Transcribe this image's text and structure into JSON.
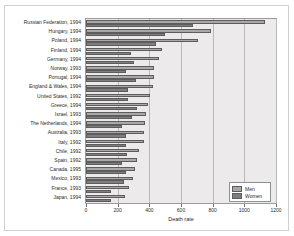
{
  "chart_data": {
    "type": "bar",
    "orientation": "horizontal",
    "title": "",
    "xlabel": "Death rate",
    "ylabel": "",
    "xlim": [
      0,
      1200
    ],
    "xticks": [
      0,
      200,
      400,
      600,
      800,
      1000,
      1200
    ],
    "xtick_labels": [
      "0",
      "200",
      "400",
      "600",
      "800",
      "1000",
      "1200"
    ],
    "grid": "vertical",
    "legend_position": "lower-right",
    "legend": [
      "Men",
      "Women"
    ],
    "categories": [
      "Russian Federation, 1994",
      "Hungary, 1994",
      "Poland, 1994",
      "Finland, 1994",
      "Germany, 1994",
      "Norway, 1993",
      "Portugal, 1994",
      "England & Wales, 1994",
      "United States, 1992",
      "Greece, 1994",
      "Israel, 1993",
      "The Netherlands, 1994",
      "Australia, 1993",
      "Italy, 1992",
      "Chile, 1992",
      "Spain, 1992",
      "Canada, 1995",
      "Mexico, 1993",
      "France, 1993",
      "Japan, 1994"
    ],
    "series": [
      {
        "name": "Men",
        "color": "#a8a8a8",
        "values": [
          1130,
          790,
          710,
          480,
          460,
          430,
          430,
          420,
          405,
          390,
          380,
          370,
          365,
          365,
          335,
          320,
          310,
          295,
          270,
          245
        ]
      },
      {
        "name": "Women",
        "color": "#7e7e7e",
        "values": [
          675,
          500,
          445,
          285,
          300,
          255,
          315,
          265,
          265,
          320,
          290,
          225,
          250,
          250,
          260,
          230,
          250,
          240,
          155,
          160
        ]
      }
    ]
  },
  "colors": {
    "plot_background": "#eceaea",
    "figure_background": "#ffffff",
    "grid": "#b9b9b9",
    "axis": "#9a9a9a",
    "men": "#a8a8a8",
    "women": "#7e7e7e"
  }
}
